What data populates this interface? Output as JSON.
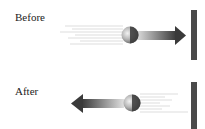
{
  "diagram": {
    "before": {
      "label": "Before",
      "ball_direction": "right",
      "arrow": "right-arrow toward wall"
    },
    "after": {
      "label": "After",
      "ball_direction": "left",
      "arrow": "left-arrow away from wall"
    }
  },
  "colors": {
    "wall": "#4a4a4a",
    "arrow_dark": "#444444",
    "arrow_light": "#dddddd",
    "ball_light": "#e8e8e8",
    "ball_dark": "#3a3a3a",
    "motion_lines": "#cccccc",
    "text": "#222222"
  }
}
